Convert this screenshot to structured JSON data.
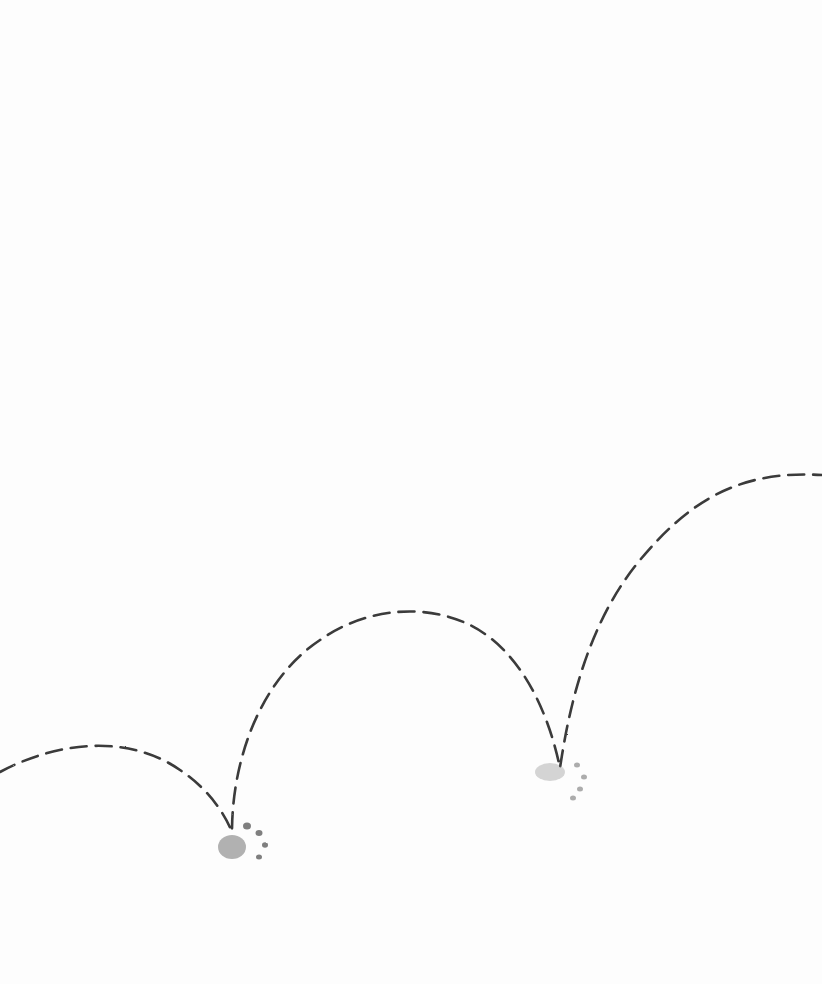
{
  "illustration": {
    "subject": "dashed bouncing trajectory with two paw-print landing marks",
    "path_color": "#3a3a3a",
    "print_color": "#555555",
    "paw_prints": [
      {
        "label": "landing-1",
        "x": 235,
        "y": 840
      },
      {
        "label": "landing-2",
        "x": 555,
        "y": 775
      }
    ]
  }
}
